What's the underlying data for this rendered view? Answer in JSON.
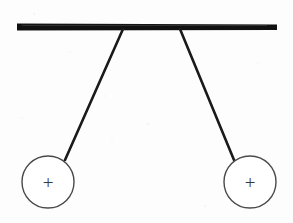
{
  "figure": {
    "background_color": "#fdfdfd",
    "width": 293,
    "height": 223
  },
  "support_bar": {
    "name": "horizontal support bar",
    "color": "#111111",
    "x_start": 17,
    "x_end": 277,
    "y_center": 27,
    "thickness": 6
  },
  "strings": [
    {
      "name": "left string",
      "color": "#1a1a1a",
      "thickness": 2.6,
      "x1": 123,
      "y1": 29,
      "x2": 65,
      "y2": 160
    },
    {
      "name": "right string",
      "color": "#1a1a1a",
      "thickness": 2.6,
      "x1": 180,
      "y1": 29,
      "x2": 234,
      "y2": 160
    }
  ],
  "spheres": [
    {
      "name": "left charged sphere",
      "charge_symbol": "+",
      "cx": 48,
      "cy": 182,
      "r": 26,
      "stroke_color": "#4a4a4a",
      "fill_color": "#ffffff",
      "stroke_width": 1.4
    },
    {
      "name": "right charged sphere",
      "charge_symbol": "+",
      "cx": 250,
      "cy": 182,
      "r": 26,
      "stroke_color": "#4a4a4a",
      "fill_color": "#ffffff",
      "stroke_width": 1.4
    }
  ]
}
